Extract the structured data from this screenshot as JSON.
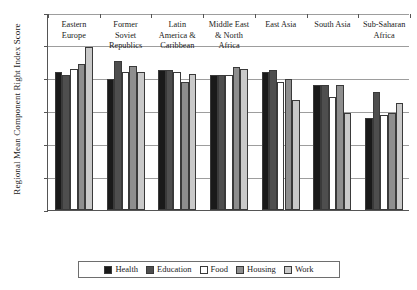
{
  "chart_data": {
    "type": "bar",
    "title": "",
    "xlabel": "",
    "ylabel": "Regional Mean Component Right Index Score",
    "ylim": [
      0,
      120
    ],
    "ytick_values": [
      0,
      20,
      40,
      60,
      80,
      100,
      120
    ],
    "ytick_labels": [
      "0",
      "20",
      "40",
      "60",
      "80",
      "100",
      "120"
    ],
    "grid": true,
    "legend_position": "bottom",
    "categories": [
      "Eastern Europe",
      "Former Soviet Republics",
      "Latin America & Caribbean",
      "Middle East & North Africa",
      "East Asia",
      "South Asia",
      "Sub-Saharan Africa"
    ],
    "category_lines": [
      [
        "Eastern",
        "Europe"
      ],
      [
        "Former",
        "Soviet",
        "Republics"
      ],
      [
        "Latin",
        "America &",
        "Caribbean"
      ],
      [
        "Middle East",
        "& North",
        "Africa"
      ],
      [
        "East Asia"
      ],
      [
        "South Asia"
      ],
      [
        "Sub-Saharan",
        "Africa"
      ]
    ],
    "series": [
      {
        "name": "Health",
        "color": "#1a1a1a",
        "values": [
          84,
          80,
          85,
          82,
          84,
          76,
          56
        ]
      },
      {
        "name": "Education",
        "color": "#4e4e4e",
        "values": [
          82,
          91,
          85,
          82,
          85,
          76,
          72
        ]
      },
      {
        "name": "Food",
        "color": "#ffffff",
        "values": [
          86,
          84,
          84,
          82,
          78,
          69,
          58
        ]
      },
      {
        "name": "Housing",
        "color": "#8e8e8e",
        "values": [
          89,
          88,
          78,
          87,
          80,
          76,
          59
        ]
      },
      {
        "name": "Work",
        "color": "#c9c9c9",
        "values": [
          99,
          84,
          83,
          86,
          67,
          59,
          65
        ]
      }
    ]
  },
  "legend": {
    "items": [
      {
        "label": "Health",
        "color": "#1a1a1a"
      },
      {
        "label": "Education",
        "color": "#4e4e4e"
      },
      {
        "label": "Food",
        "color": "#ffffff"
      },
      {
        "label": "Housing",
        "color": "#8e8e8e"
      },
      {
        "label": "Work",
        "color": "#c9c9c9"
      }
    ]
  }
}
